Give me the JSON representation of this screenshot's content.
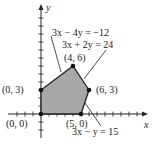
{
  "chart_data": {
    "type": "diagram",
    "title": "",
    "xlabel": "x",
    "ylabel": "y",
    "xlim": [
      -3,
      12
    ],
    "ylim": [
      -3,
      13
    ],
    "region_vertices": [
      [
        0,
        0
      ],
      [
        0,
        3
      ],
      [
        4,
        6
      ],
      [
        6,
        3
      ],
      [
        5,
        0
      ]
    ],
    "region_fill": "#a8a8a8",
    "vertex_labels": [
      {
        "point": [
          0,
          0
        ],
        "label": "(0, 0)"
      },
      {
        "point": [
          0,
          3
        ],
        "label": "(0, 3)"
      },
      {
        "point": [
          4,
          6
        ],
        "label": "(4, 6)"
      },
      {
        "point": [
          6,
          3
        ],
        "label": "(6, 3)"
      },
      {
        "point": [
          5,
          0
        ],
        "label": "(5, 0)"
      }
    ],
    "constraint_labels": [
      {
        "equation": "3x − 4y = −12"
      },
      {
        "equation": "3x + 2y = 24"
      },
      {
        "equation": "3x − y = 15"
      }
    ]
  }
}
